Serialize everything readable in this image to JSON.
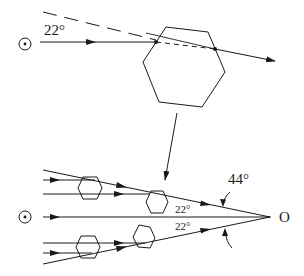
{
  "figure": {
    "top_panel": {
      "angle_label": "22°",
      "incident_ray": "horizontal ray entering hexagonal crystal",
      "deviation_angle_deg": 22
    },
    "bottom_panel": {
      "apex_label": "O",
      "total_angle_label": "44°",
      "upper_angle_label": "22°",
      "lower_angle_label": "22°",
      "crystal_count": 4
    },
    "symbols": {
      "source": "circle-dot-icon"
    },
    "colors": {
      "ink": "#1a1a1a",
      "background": "#ffffff"
    }
  }
}
